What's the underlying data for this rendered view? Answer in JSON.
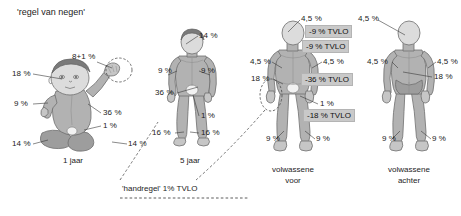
{
  "title": "'regel van negen'",
  "figures": {
    "infant": {
      "caption": "1 jaar",
      "labels": {
        "head_left": "18 %",
        "arm_upper": "8+1 %",
        "arm_left": "9 %",
        "trunk": "36 %",
        "genital": "1 %",
        "leg_left": "14 %",
        "leg_right": "14 %"
      }
    },
    "child5": {
      "caption": "5 jaar",
      "labels": {
        "head": "14 %",
        "arm_left": "9 %",
        "arm_right": "9 %",
        "trunk": "36 %",
        "genital": "1 %",
        "leg_left": "16 %",
        "leg_right": "16 %"
      }
    },
    "adult_front": {
      "caption_line1": "volwassene",
      "caption_line2": "voor",
      "labels": {
        "head": "4,5 %",
        "arm_left": "4,5 %",
        "arm_right": "4,5 %",
        "hand": "18 %",
        "genital": "1 %",
        "leg_left": "9 %",
        "leg_right": "9 %"
      }
    },
    "adult_back": {
      "caption_line1": "volwassene",
      "caption_line2": "achter",
      "labels": {
        "head": "4,5 %",
        "arm_left": "4,5 %",
        "arm_right": "4,5 %",
        "trunk": "18 %",
        "leg_left": "9 %",
        "leg_right": "9 %"
      }
    }
  },
  "tvlo_callouts": [
    {
      "id": "head",
      "text": "-9 % TVLO"
    },
    {
      "id": "arms",
      "text": "-9 % TVLO"
    },
    {
      "id": "trunk",
      "text": "-36 % TVLO"
    },
    {
      "id": "legs",
      "text": "-18 % TVLO"
    }
  ],
  "hand_rule": {
    "text": "'handregel' 1% TVLO"
  }
}
